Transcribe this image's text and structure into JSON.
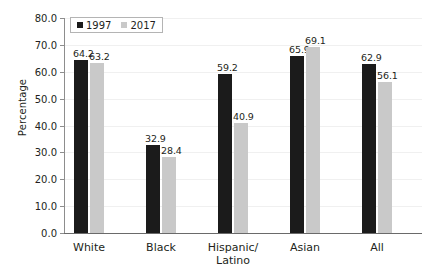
{
  "chart_data": {
    "type": "bar",
    "title": "",
    "subtitle": "",
    "xlabel": "",
    "ylabel": "Percentage",
    "categories": [
      "White",
      "Black",
      "Hispanic/\nLatino",
      "Asian",
      "All"
    ],
    "series": [
      {
        "name": "1997",
        "color": "#1b1b1b",
        "values": [
          64.2,
          32.9,
          59.2,
          65.9,
          62.9
        ]
      },
      {
        "name": "2017",
        "color": "#c9c9c9",
        "values": [
          63.2,
          28.4,
          40.9,
          69.1,
          56.1
        ]
      }
    ],
    "ylim": [
      0,
      80
    ],
    "ytick_labels": [
      "0.0",
      "10.0",
      "20.0",
      "30.0",
      "40.0",
      "50.0",
      "60.0",
      "70.0",
      "80.0"
    ],
    "ytick_values": [
      0,
      10,
      20,
      30,
      40,
      50,
      60,
      70,
      80
    ],
    "grid": true,
    "grid_color": "#f0f0f0",
    "legend_position": "top-left",
    "value_labels": [
      [
        "64.2",
        "63.2"
      ],
      [
        "32.9",
        "28.4"
      ],
      [
        "59.2",
        "40.9"
      ],
      [
        "65.9",
        "69.1"
      ],
      [
        "62.9",
        "56.1"
      ]
    ]
  }
}
